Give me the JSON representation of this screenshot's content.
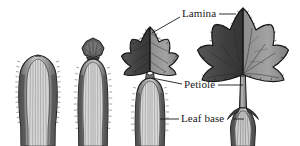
{
  "figure": {
    "background_color": "#ffffff",
    "ink_color": "#1a1a1a",
    "style": "grayscale botanical line illustration with stippled shading"
  },
  "labels": [
    {
      "id": "lamina",
      "text": "Lamina",
      "x": 182,
      "y": 8,
      "leaders": [
        {
          "from": "label-left",
          "to": "stage3-lamina",
          "x1": 180,
          "y1": 17,
          "x2": 152,
          "y2": 33
        },
        {
          "from": "label-right",
          "to": "stage4-lamina",
          "x1": 219,
          "y1": 14,
          "x2": 236,
          "y2": 14
        }
      ]
    },
    {
      "id": "petiole",
      "text": "Petiole",
      "x": 184,
      "y": 79,
      "leaders": [
        {
          "from": "label-left",
          "to": "stage3-petiole",
          "x1": 182,
          "y1": 84,
          "x2": 152,
          "y2": 78
        },
        {
          "from": "label-right",
          "to": "stage4-petiole",
          "x1": 218,
          "y1": 85,
          "x2": 243,
          "y2": 85
        }
      ]
    },
    {
      "id": "leaf-base",
      "text": "Leaf base",
      "x": 181,
      "y": 113,
      "leaders": [
        {
          "from": "label-left",
          "to": "stage3-leafbase",
          "x1": 179,
          "y1": 119,
          "x2": 160,
          "y2": 119
        },
        {
          "from": "label-right",
          "to": "stage4-leafbase",
          "x1": 233,
          "y1": 119,
          "x2": 244,
          "y2": 119
        }
      ]
    }
  ],
  "stages": [
    {
      "id": "stage-1",
      "name": "youngest-leaf-sheath",
      "description": "Closed sheathing leaf base with vertical striations and hairy margins; lamina not yet emerged",
      "center_x": 38,
      "has_lamina": false,
      "has_petiole": false,
      "has_leaf_base": true
    },
    {
      "id": "stage-2",
      "name": "leaf-with-emerging-lamina-bud",
      "description": "Sheath with a small folded lamina bud at the apex",
      "center_x": 93,
      "has_lamina": true,
      "has_petiole": false,
      "has_leaf_base": true
    },
    {
      "id": "stage-3",
      "name": "leaf-with-expanding-lamina",
      "description": "Expanded serrated palmate lamina above a short petiole and broad sheathing leaf base",
      "center_x": 150,
      "has_lamina": true,
      "has_petiole": true,
      "has_leaf_base": true
    },
    {
      "id": "stage-4",
      "name": "mature-leaf",
      "description": "Fully expanded five-lobed palmate lamina with toothed margins, long slender petiole and flared leaf base",
      "center_x": 243,
      "has_lamina": true,
      "has_petiole": true,
      "has_leaf_base": true
    }
  ],
  "colors": {
    "outline": "#1a1a1a",
    "lamina_dark": "#4a4a4a",
    "lamina_mid": "#6e6e6e",
    "lamina_light": "#9a9a9a",
    "sheath_dark": "#5a5a5a",
    "sheath_mid": "#8c8c8c",
    "sheath_light": "#c9c9c9",
    "vein": "#2e2e2e"
  }
}
